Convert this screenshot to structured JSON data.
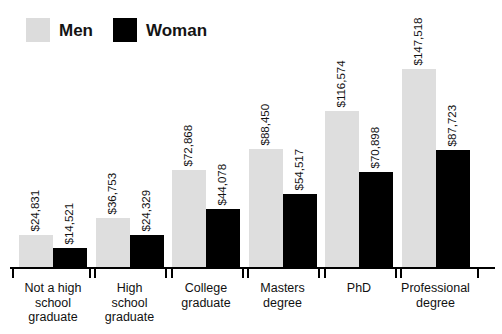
{
  "legend": {
    "entries": [
      {
        "label": "Men",
        "color": "#dcdcdc",
        "swatch_name": "legend-swatch-men"
      },
      {
        "label": "Woman",
        "color": "#000000",
        "swatch_name": "legend-swatch-woman"
      }
    ]
  },
  "chart_data": {
    "type": "bar",
    "title": "",
    "subtitle": "",
    "xlabel": "",
    "ylabel": "",
    "grid": false,
    "legend_position": "top-left",
    "ylim": [
      0,
      147518
    ],
    "categories": [
      "Not a high school graduate",
      "High school graduate",
      "College graduate",
      "Masters degree",
      "PhD",
      "Professional degree"
    ],
    "category_lines": [
      [
        "Not a high",
        "school",
        "graduate"
      ],
      [
        "High",
        "school",
        "graduate"
      ],
      [
        "College",
        "graduate"
      ],
      [
        "Masters",
        "degree"
      ],
      [
        "PhD"
      ],
      [
        "Professional",
        "degree"
      ]
    ],
    "series": [
      {
        "name": "Men",
        "color": "#dcdcdc",
        "values": [
          24831,
          36753,
          72868,
          88450,
          116574,
          147518
        ],
        "labels": [
          "$24,831",
          "$36,753",
          "$72,868",
          "$88,450",
          "$116,574",
          "$147,518"
        ]
      },
      {
        "name": "Woman",
        "color": "#000000",
        "values": [
          14521,
          24329,
          44078,
          54517,
          70898,
          87723
        ],
        "labels": [
          "$14,521",
          "$24,329",
          "$44,078",
          "$54,517",
          "$70,898",
          "$87,723"
        ]
      }
    ]
  }
}
